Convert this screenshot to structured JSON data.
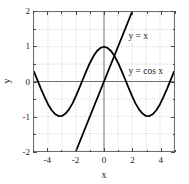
{
  "chart_data": {
    "type": "line",
    "title": "",
    "xlabel": "x",
    "ylabel": "y",
    "xlim": [
      -5,
      5
    ],
    "ylim": [
      -2,
      2
    ],
    "grid": true,
    "grid_style": "dotted",
    "grid_color": "#b9b9b9",
    "axis_color": "#6e6e6e",
    "curve_color": "#000000",
    "background": "#ffffff",
    "legend_position": "inside-annotations",
    "xticks": [
      -4,
      -2,
      0,
      2,
      4
    ],
    "xtick_labels": [
      "-4",
      "-2",
      "0",
      "2",
      "4"
    ],
    "yticks": [
      -2,
      -1,
      0,
      1,
      2
    ],
    "ytick_labels": [
      "-2",
      "-1",
      "0",
      "1",
      "2"
    ],
    "xminor_step": 1,
    "yminor_step": 0.5,
    "series": [
      {
        "name": "y = cos x",
        "label": "y = cos x",
        "type": "cosine",
        "amplitude": 1,
        "period": 6.283185307179586,
        "x": [
          -5,
          -4.75,
          -4.5,
          -4.25,
          -4,
          -3.75,
          -3.5,
          -3.25,
          -3,
          -2.75,
          -2.5,
          -2.25,
          -2,
          -1.75,
          -1.5,
          -1.25,
          -1,
          -0.75,
          -0.5,
          -0.25,
          0,
          0.25,
          0.5,
          0.75,
          1,
          1.25,
          1.5,
          1.75,
          2,
          2.25,
          2.5,
          2.75,
          3,
          3.25,
          3.5,
          3.75,
          4,
          4.25,
          4.5,
          4.75,
          5
        ],
        "values": [
          0.284,
          0.034,
          -0.211,
          -0.441,
          -0.654,
          -0.821,
          -0.936,
          -0.994,
          -0.99,
          -0.924,
          -0.801,
          -0.628,
          -0.416,
          -0.178,
          0.071,
          0.315,
          0.54,
          0.732,
          0.878,
          0.969,
          1,
          0.969,
          0.878,
          0.732,
          0.54,
          0.315,
          0.071,
          -0.178,
          -0.416,
          -0.628,
          -0.801,
          -0.924,
          -0.99,
          -0.994,
          -0.936,
          -0.821,
          -0.654,
          -0.441,
          -0.211,
          0.034,
          0.284
        ]
      },
      {
        "name": "y = x",
        "label": "y = x",
        "type": "linear",
        "slope": 1,
        "intercept": 0,
        "x": [
          -2,
          2
        ],
        "values": [
          -2,
          2
        ]
      }
    ],
    "annotations": [
      {
        "text": "y = x",
        "x": 1.72,
        "y": 1.27
      },
      {
        "text": "y = cos x",
        "x": 1.72,
        "y": 0.27
      }
    ]
  }
}
